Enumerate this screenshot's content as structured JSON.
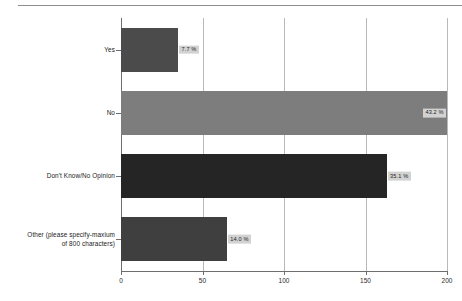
{
  "chart_data": {
    "type": "bar",
    "orientation": "horizontal",
    "title": "",
    "xlabel": "",
    "ylabel": "",
    "xlim": [
      0,
      200
    ],
    "xticks": [
      "0",
      "50",
      "100",
      "150",
      "200"
    ],
    "grid": true,
    "legend": false,
    "categories": [
      "Yes",
      "No",
      "Don't Know/No Opinion",
      "Other (please specify-maxium\nof 800 characters)"
    ],
    "values": [
      35,
      200,
      163,
      65
    ],
    "data_labels": [
      "7.7 %",
      "43.2 %",
      "35.1 %",
      "14.0 %"
    ],
    "bar_colors": [
      "#4b4b4b",
      "#7d7d7d",
      "#252525",
      "#3f3f3f"
    ],
    "label_background": "#d2d2d2",
    "axis_color": "#6e6e6e",
    "gridline_color": "#b9b9b9"
  }
}
